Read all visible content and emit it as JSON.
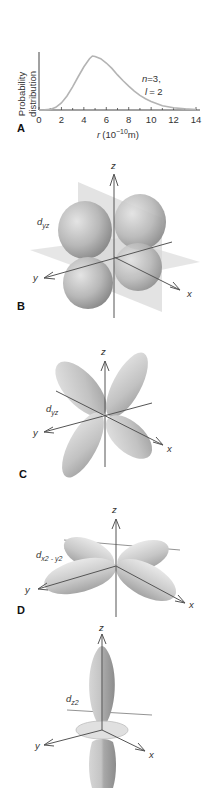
{
  "figure": {
    "panels": [
      {
        "id": "A",
        "label": "A",
        "type": "chart"
      },
      {
        "id": "B",
        "label": "B",
        "orbital": "d",
        "orbital_sub": "yz",
        "description": "d_yz orbital with nodal planes (xz and xy planes shaded)"
      },
      {
        "id": "C",
        "label": "C",
        "orbital": "d",
        "orbital_sub": "yz",
        "description": "d_yz orbital lobes"
      },
      {
        "id": "D",
        "label": "D",
        "orbital": "d",
        "orbital_sub": "x2 - y2",
        "description": "d_x2-y2 orbital lobes"
      },
      {
        "id": "E",
        "label": "",
        "orbital": "d",
        "orbital_sub": "z2",
        "description": "d_z2 orbital with torus ring"
      }
    ],
    "axes": {
      "x": "x",
      "y": "y",
      "z": "z"
    },
    "colors": {
      "curve": "#b4b4b4",
      "lobe_light": "#e2e2e2",
      "lobe_mid": "#bdbdbd",
      "lobe_dark": "#8e8e8e",
      "plane": "#d8d8d8",
      "axis": "#555555"
    }
  },
  "chart_data": {
    "type": "line",
    "title": "",
    "xlabel": "r (10⁻¹⁰m)",
    "xlabel_parts": {
      "var": "r",
      "unit_pre": "(10",
      "exp": "−10",
      "unit_post": "m)"
    },
    "ylabel": "Probability distribution",
    "ylabel_lines": [
      "Probability",
      "distribution"
    ],
    "xlim": [
      0,
      14
    ],
    "xticks": [
      0,
      2,
      4,
      6,
      8,
      10,
      12,
      14
    ],
    "yticks": [],
    "grid": false,
    "legend": null,
    "annotation": {
      "line1": "n = 3,",
      "line2": "l = 2",
      "n_var": "n",
      "n_val": "=3,",
      "l_var": "l",
      "l_val": "= 2"
    },
    "series": [
      {
        "name": "3d radial probability (n=3, l=2)",
        "x": [
          0,
          0.5,
          1,
          1.5,
          2,
          2.5,
          3,
          3.5,
          4,
          4.5,
          4.76,
          5,
          5.5,
          6,
          6.5,
          7,
          7.5,
          8,
          8.5,
          9,
          9.5,
          10,
          11,
          12,
          13,
          14
        ],
        "values": [
          0,
          0.001,
          0.012,
          0.05,
          0.13,
          0.26,
          0.43,
          0.62,
          0.8,
          0.95,
          1.0,
          0.99,
          0.95,
          0.87,
          0.77,
          0.65,
          0.54,
          0.44,
          0.35,
          0.27,
          0.21,
          0.16,
          0.08,
          0.04,
          0.02,
          0.01
        ]
      }
    ],
    "peak": {
      "x": 4.76,
      "y": 1.0
    }
  }
}
